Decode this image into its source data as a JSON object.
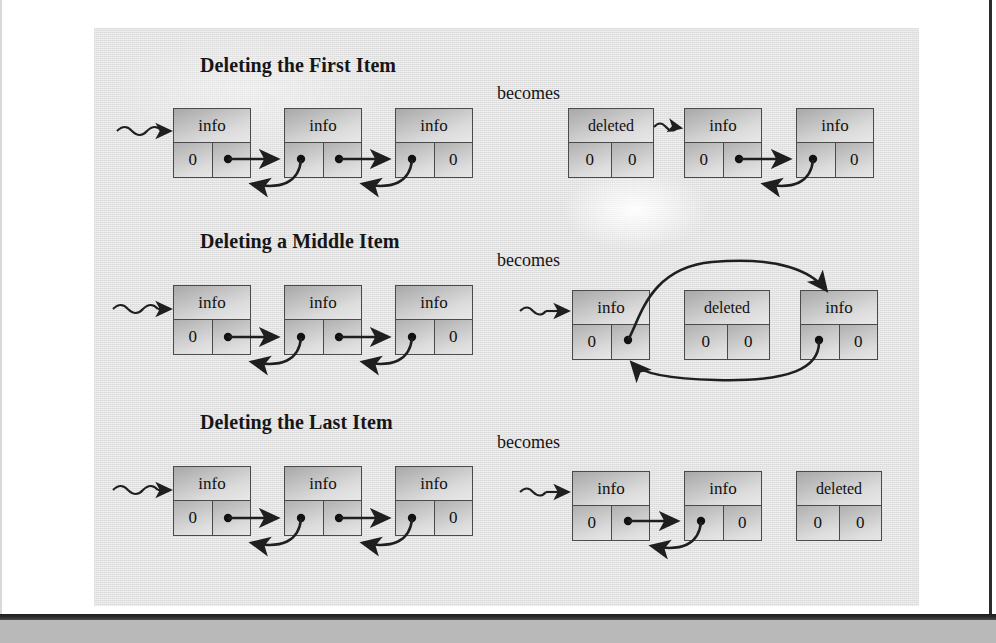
{
  "figure": {
    "label": "doubly-linked-list-deletion-diagram",
    "background_color": "#e2e2e2",
    "ink_color": "#1f1f1f",
    "box_border_color": "#4a4a4a"
  },
  "becomes_label": "becomes",
  "node_labels": {
    "info": "info",
    "deleted": "deleted",
    "zero": "0"
  },
  "sections": [
    {
      "id": "delete-first",
      "title": "Deleting the First Item",
      "becomes": "becomes",
      "before": {
        "head_pointer": true,
        "nodes": [
          {
            "top": "info",
            "left": "0",
            "right": "ptr"
          },
          {
            "top": "info",
            "left": "ptr",
            "right": "ptr"
          },
          {
            "top": "info",
            "left": "ptr",
            "right": "0"
          }
        ]
      },
      "after": {
        "head_pointer": false,
        "nodes": [
          {
            "top": "deleted",
            "left": "0",
            "right": "0"
          },
          {
            "top": "info",
            "left": "0",
            "right": "ptr"
          },
          {
            "top": "info",
            "left": "ptr",
            "right": "0"
          }
        ]
      }
    },
    {
      "id": "delete-middle",
      "title": "Deleting a Middle Item",
      "becomes": "becomes",
      "before": {
        "head_pointer": true,
        "nodes": [
          {
            "top": "info",
            "left": "0",
            "right": "ptr"
          },
          {
            "top": "info",
            "left": "ptr",
            "right": "ptr"
          },
          {
            "top": "info",
            "left": "ptr",
            "right": "0"
          }
        ]
      },
      "after": {
        "head_pointer": true,
        "nodes": [
          {
            "top": "info",
            "left": "0",
            "right": "ptr"
          },
          {
            "top": "deleted",
            "left": "0",
            "right": "0"
          },
          {
            "top": "info",
            "left": "ptr",
            "right": "0"
          }
        ]
      }
    },
    {
      "id": "delete-last",
      "title": "Deleting the Last Item",
      "becomes": "becomes",
      "before": {
        "head_pointer": true,
        "nodes": [
          {
            "top": "info",
            "left": "0",
            "right": "ptr"
          },
          {
            "top": "info",
            "left": "ptr",
            "right": "ptr"
          },
          {
            "top": "info",
            "left": "ptr",
            "right": "0"
          }
        ]
      },
      "after": {
        "head_pointer": true,
        "nodes": [
          {
            "top": "info",
            "left": "0",
            "right": "ptr"
          },
          {
            "top": "info",
            "left": "ptr",
            "right": "0"
          },
          {
            "top": "deleted",
            "left": "0",
            "right": "0"
          }
        ]
      }
    }
  ]
}
